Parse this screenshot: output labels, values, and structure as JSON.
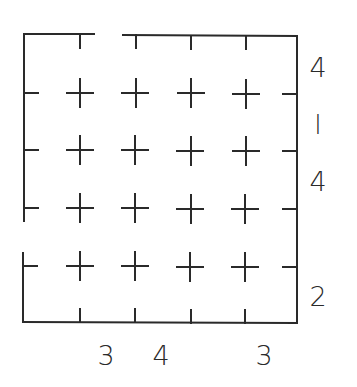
{
  "diagram": {
    "type": "grid-puzzle",
    "stroke_color": "#2a2a2a",
    "grid": {
      "columns_x": [
        80,
        135,
        190,
        245
      ],
      "rows_y": [
        92,
        150,
        208,
        266
      ],
      "plus_count": 16
    },
    "right_labels": [
      {
        "text": "4",
        "y": 76
      },
      {
        "text": "l",
        "y": 132
      },
      {
        "text": "4",
        "y": 190
      },
      {
        "text": "2",
        "y": 306
      }
    ],
    "bottom_labels": [
      {
        "text": "3",
        "x": 106
      },
      {
        "text": "4",
        "x": 162
      },
      {
        "text": "3",
        "x": 262
      }
    ]
  }
}
